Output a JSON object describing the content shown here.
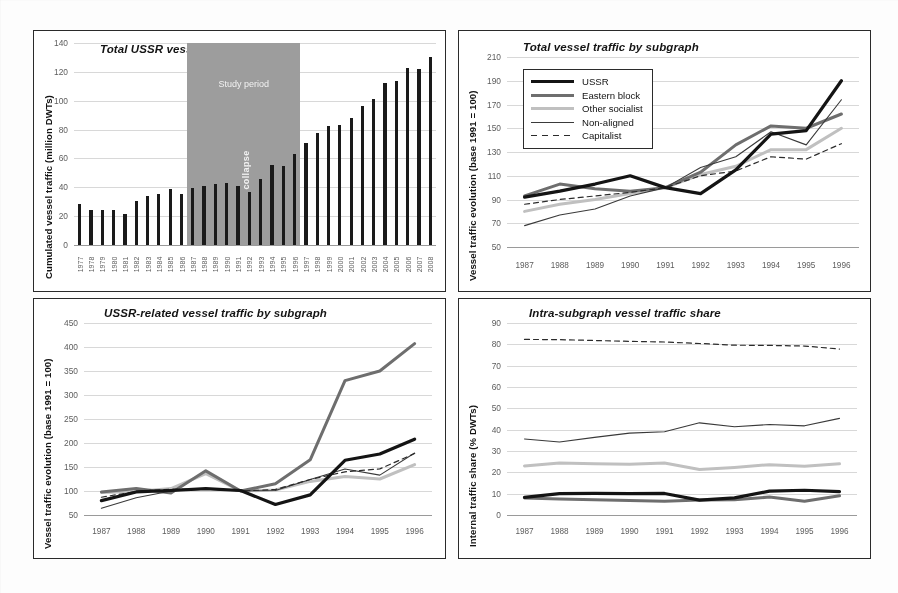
{
  "figure": {
    "background": "#ffffff",
    "panel_border": "#2a2a2a"
  },
  "series_style": {
    "ussr": {
      "name": "USSR",
      "color": "#141414",
      "width": 3.2,
      "dash": "none"
    },
    "eastern": {
      "name": "Eastern block",
      "color": "#6e6e6e",
      "width": 3.0,
      "dash": "none"
    },
    "other_socialist": {
      "name": "Other socialist",
      "color": "#c0c0c0",
      "width": 3.0,
      "dash": "none"
    },
    "non_aligned": {
      "name": "Non-aligned",
      "color": "#3a3a3a",
      "width": 1.1,
      "dash": "none"
    },
    "capitalist": {
      "name": "Capitalist",
      "color": "#2b2b2b",
      "width": 1.2,
      "dash": "5,4"
    }
  },
  "panels": {
    "top_left": {
      "title": "Total USSR vessel traffic",
      "ylabel": "Cumulated vessel traffic (million DWTs)",
      "annotations": {
        "study_period": "Study period",
        "collapse": "collapse"
      }
    },
    "top_right": {
      "title": "Total vessel traffic by subgraph",
      "ylabel": "Vessel traffic evolution (base 1991 = 100)",
      "legend": [
        "USSR",
        "Eastern block",
        "Other socialist",
        "Non-aligned",
        "Capitalist"
      ]
    },
    "bottom_left": {
      "title": "USSR-related vessel traffic by subgraph",
      "ylabel": "Vessel traffic evolution (base 1991 = 100)"
    },
    "bottom_right": {
      "title": "Intra-subgraph vessel traffic share",
      "ylabel": "Internal traffic share (% DWTs)"
    }
  },
  "chart_data": [
    {
      "id": "total-ussr-vessel-traffic",
      "type": "bar",
      "title": "Total USSR vessel traffic",
      "xlabel": "",
      "ylabel": "Cumulated vessel traffic (million DWTs)",
      "ylim": [
        0,
        140
      ],
      "yticks": [
        0,
        20,
        40,
        60,
        80,
        100,
        120,
        140
      ],
      "grid": true,
      "bar_color": "#1a1a1a",
      "shaded_region": {
        "label": "Study period",
        "secondary_label": "collapse",
        "from": "1987",
        "to": "1996",
        "color": "#9d9d9d"
      },
      "categories": [
        "1977",
        "1978",
        "1979",
        "1980",
        "1981",
        "1982",
        "1983",
        "1984",
        "1985",
        "1986",
        "1987",
        "1988",
        "1989",
        "1990",
        "1991",
        "1992",
        "1993",
        "1994",
        "1995",
        "1996",
        "1997",
        "1998",
        "1999",
        "2000",
        "2001",
        "2002",
        "2003",
        "2004",
        "2005",
        "2006",
        "2007",
        "2008"
      ],
      "values": [
        28.5,
        24.5,
        24.5,
        24.0,
        21.5,
        30.5,
        34.0,
        35.5,
        38.5,
        35.5,
        39.5,
        41.0,
        42.5,
        43.0,
        41.0,
        36.5,
        45.5,
        55.5,
        54.5,
        63.0,
        70.5,
        78.0,
        82.5,
        83.5,
        88.0,
        96.5,
        101.0,
        112.5,
        114.0,
        123.0,
        122.0,
        130.0
      ]
    },
    {
      "id": "total-vessel-traffic-by-subgraph",
      "type": "line",
      "title": "Total vessel traffic by subgraph",
      "xlabel": "",
      "ylabel": "Vessel traffic evolution (base 1991 = 100)",
      "ylim": [
        50,
        210
      ],
      "yticks": [
        50,
        70,
        90,
        110,
        130,
        150,
        170,
        190,
        210
      ],
      "grid": true,
      "legend_position": "upper-left",
      "categories": [
        "1987",
        "1988",
        "1989",
        "1990",
        "1991",
        "1992",
        "1993",
        "1994",
        "1995",
        "1996"
      ],
      "series": [
        {
          "name": "USSR",
          "values": [
            92,
            97,
            103,
            110,
            100,
            95,
            115,
            145,
            148,
            190
          ]
        },
        {
          "name": "Eastern block",
          "values": [
            93,
            103,
            99,
            97,
            100,
            113,
            136,
            152,
            150,
            162
          ]
        },
        {
          "name": "Other socialist",
          "values": [
            80,
            86,
            90,
            95,
            100,
            111,
            118,
            132,
            132,
            150
          ]
        },
        {
          "name": "Non-aligned",
          "values": [
            68,
            77,
            82,
            93,
            100,
            117,
            126,
            147,
            136,
            174
          ]
        },
        {
          "name": "Capitalist",
          "values": [
            86,
            90,
            93,
            96,
            100,
            110,
            114,
            126,
            124,
            137
          ]
        }
      ]
    },
    {
      "id": "ussr-related-vessel-traffic-by-subgraph",
      "type": "line",
      "title": "USSR-related vessel traffic by subgraph",
      "xlabel": "",
      "ylabel": "Vessel traffic evolution (base 1991 = 100)",
      "ylim": [
        50,
        450
      ],
      "yticks": [
        50,
        100,
        150,
        200,
        250,
        300,
        350,
        400,
        450
      ],
      "grid": true,
      "categories": [
        "1987",
        "1988",
        "1989",
        "1990",
        "1991",
        "1992",
        "1993",
        "1994",
        "1995",
        "1996"
      ],
      "series": [
        {
          "name": "USSR",
          "values": [
            80,
            98,
            101,
            105,
            101,
            72,
            92,
            164,
            177,
            208
          ]
        },
        {
          "name": "Eastern block",
          "values": [
            98,
            105,
            96,
            142,
            100,
            115,
            165,
            330,
            350,
            407
          ]
        },
        {
          "name": "Other socialist",
          "values": [
            97,
            99,
            105,
            136,
            100,
            102,
            120,
            130,
            125,
            155
          ]
        },
        {
          "name": "Non-aligned",
          "values": [
            64,
            86,
            100,
            104,
            100,
            101,
            124,
            146,
            133,
            179
          ]
        },
        {
          "name": "Capitalist",
          "values": [
            87,
            99,
            104,
            104,
            100,
            103,
            124,
            140,
            146,
            178
          ]
        }
      ]
    },
    {
      "id": "intra-subgraph-vessel-traffic-share",
      "type": "line",
      "title": "Intra-subgraph vessel traffic share",
      "xlabel": "",
      "ylabel": "Internal traffic share (% DWTs)",
      "ylim": [
        0,
        90
      ],
      "yticks": [
        0,
        10,
        20,
        30,
        40,
        50,
        60,
        70,
        80,
        90
      ],
      "grid": true,
      "categories": [
        "1987",
        "1988",
        "1989",
        "1990",
        "1991",
        "1992",
        "1993",
        "1994",
        "1995",
        "1996"
      ],
      "series": [
        {
          "name": "USSR",
          "values": [
            8.3,
            10.0,
            10.1,
            10.0,
            10.1,
            7.0,
            8.0,
            11.2,
            11.6,
            11.0
          ]
        },
        {
          "name": "Eastern block",
          "values": [
            8.0,
            7.5,
            7.1,
            6.8,
            6.5,
            7.0,
            7.2,
            8.4,
            6.4,
            9.0
          ]
        },
        {
          "name": "Other socialist",
          "values": [
            23.0,
            24.4,
            24.0,
            23.8,
            24.4,
            21.3,
            22.3,
            23.6,
            22.8,
            24.0
          ]
        },
        {
          "name": "Non-aligned",
          "values": [
            35.6,
            34.2,
            36.4,
            38.4,
            39.0,
            43.2,
            41.4,
            42.4,
            41.8,
            45.3
          ]
        },
        {
          "name": "Capitalist",
          "values": [
            82.3,
            82.2,
            81.8,
            81.4,
            81.1,
            80.4,
            79.6,
            79.5,
            79.2,
            77.8
          ]
        }
      ]
    }
  ]
}
